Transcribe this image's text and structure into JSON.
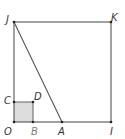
{
  "diagram": {
    "colors": {
      "line": "#555555",
      "point": "#222222",
      "shaded_fill": "#dcdcdc",
      "label": "#333333",
      "label_gray": "#7a7a7a"
    },
    "points": {
      "J": {
        "label": "J",
        "x": 14,
        "y": 22
      },
      "K": {
        "label": "K",
        "x": 111,
        "y": 22
      },
      "O": {
        "label": "O",
        "x": 14,
        "y": 122
      },
      "I": {
        "label": "I",
        "x": 111,
        "y": 122
      },
      "C": {
        "label": "C",
        "x": 14,
        "y": 102
      },
      "D": {
        "label": "D",
        "x": 33,
        "y": 102
      },
      "B": {
        "label": "B",
        "x": 33,
        "y": 122
      },
      "A": {
        "label": "A",
        "x": 62,
        "y": 122
      }
    },
    "shapes": {
      "large_square": "OIKJ",
      "small_square_shaded": "OBDC",
      "segment": "JA"
    }
  }
}
